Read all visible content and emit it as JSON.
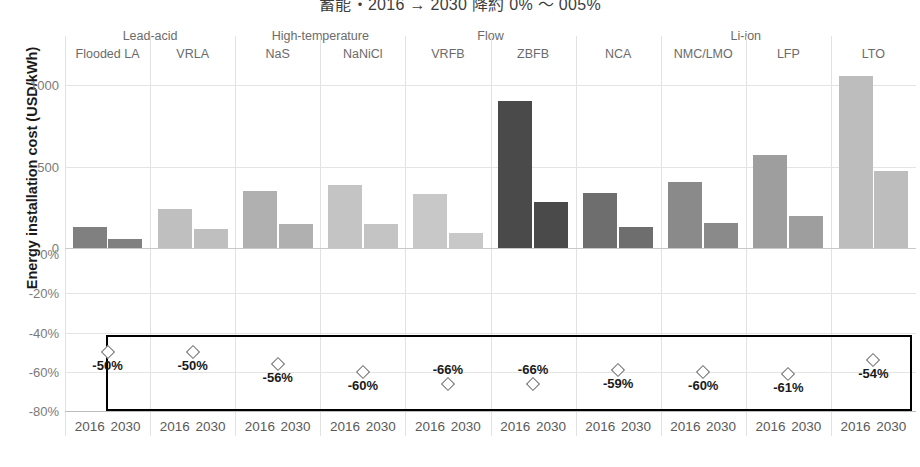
{
  "title": "蓄能・2016 → 2030 降約 0% ～ 005%",
  "y_axis": {
    "label": "Energy installation cost (USD/kWh)",
    "cost_ticks": [
      {
        "value": 1000,
        "text": "1000"
      },
      {
        "value": 500,
        "text": "500"
      },
      {
        "value": 0,
        "text": "0"
      }
    ],
    "pct_ticks": [
      {
        "value": 0,
        "text": "0%"
      },
      {
        "value": -20,
        "text": "-20%"
      },
      {
        "value": -40,
        "text": "-40%"
      },
      {
        "value": -60,
        "text": "-60%"
      },
      {
        "value": -80,
        "text": "-80%"
      }
    ]
  },
  "groups": [
    {
      "label": "",
      "technologies": [
        "Flooded LA",
        "VRLA"
      ],
      "family": "Lead-acid"
    },
    {
      "label": "",
      "technologies": [
        "NaS",
        "NaNiCl"
      ],
      "family": "High-temperature"
    },
    {
      "label": "",
      "technologies": [
        "VRFB",
        "ZBFB"
      ],
      "family": "Flow"
    },
    {
      "label": "",
      "technologies": [
        "NCA",
        "NMC/LMO",
        "LFP",
        "LTO"
      ],
      "family": "Li-ion"
    }
  ],
  "family_headers": [
    {
      "text": "Lead-acid",
      "span_start": 0,
      "span_end": 1
    },
    {
      "text": "High-temperature",
      "span_start": 2,
      "span_end": 3
    },
    {
      "text": "Flow",
      "span_start": 4,
      "span_end": 5
    },
    {
      "text": "Li-ion",
      "span_start": 6,
      "span_end": 9
    }
  ],
  "year_labels": [
    "2016",
    "2030"
  ],
  "colors": {
    "flooded_la": "#808080",
    "vrla": "#bfbfbf",
    "nas": "#b0b0b0",
    "nanicl": "#c4c4c4",
    "vrfb": "#c8c8c8",
    "zbfb": "#4a4a4a",
    "nca": "#6e6e6e",
    "nmc_lmo": "#8a8a8a",
    "lfp": "#9e9e9e",
    "lto": "#bdbdbd",
    "box_border": "#000000",
    "marker_outline": "#6e6e6e"
  },
  "chart_data": {
    "type": "bar",
    "title": "蓄能・2016 → 2030 降約 0% ～ 005%",
    "xlabel": "",
    "ylabel": "Energy installation cost (USD/kWh)",
    "ylim": [
      0,
      1100
    ],
    "grid": true,
    "legend": "none",
    "categories": [
      "Flooded LA",
      "VRLA",
      "NaS",
      "NaNiCl",
      "VRFB",
      "ZBFB",
      "NCA",
      "NMC/LMO",
      "LFP",
      "LTO"
    ],
    "series": [
      {
        "name": "2016",
        "values": [
          130,
          240,
          350,
          385,
          330,
          900,
          335,
          405,
          570,
          1055
        ]
      },
      {
        "name": "2030",
        "values": [
          55,
          115,
          145,
          150,
          95,
          285,
          130,
          155,
          195,
          470
        ]
      }
    ],
    "reduction_pct": {
      "name": "Cost reduction 2016→2030",
      "marker": "diamond",
      "unit": "%",
      "values": [
        -50,
        -50,
        -56,
        -60,
        -66,
        -66,
        -59,
        -60,
        -61,
        -54
      ],
      "labels": [
        "-50%",
        "-50%",
        "-56%",
        "-60%",
        "-66%",
        "-66%",
        "-59%",
        "-60%",
        "-61%",
        "-54%"
      ],
      "label_position": [
        "below",
        "below",
        "below",
        "below",
        "above",
        "above",
        "below",
        "below",
        "below",
        "below"
      ]
    },
    "annotations": [
      {
        "type": "box",
        "description": "black rectangle enclosing the percent reduction markers"
      }
    ]
  }
}
